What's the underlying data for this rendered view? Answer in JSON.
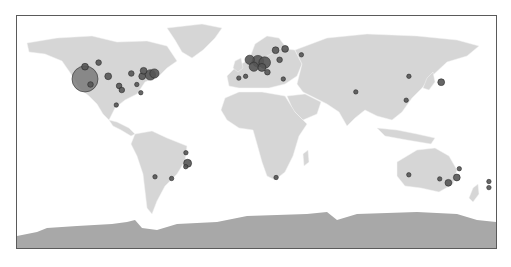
{
  "map": {
    "type": "world-bubble-map",
    "colors": {
      "land": "#d6d6d6",
      "antarctica": "#a8a8a8",
      "ocean": "#ffffff",
      "bubble_fill": "#555555",
      "bubble_fill_large": "#7a7a7a",
      "frame": "#5a5a5a"
    },
    "markers": [
      {
        "region": "us-west-coast",
        "lon": -122,
        "lat": 38,
        "size": 10
      },
      {
        "region": "us-northwest",
        "lon": -122,
        "lat": 47,
        "size": 2
      },
      {
        "region": "us-west",
        "lon": -112,
        "lat": 50,
        "size": 1.5
      },
      {
        "region": "us-southwest",
        "lon": -118,
        "lat": 34,
        "size": 1.5
      },
      {
        "region": "us-central",
        "lon": -105,
        "lat": 40,
        "size": 2
      },
      {
        "region": "us-central",
        "lon": -97,
        "lat": 33,
        "size": 1.5
      },
      {
        "region": "us-central",
        "lon": -95,
        "lat": 30,
        "size": 1.5
      },
      {
        "region": "us-midwest",
        "lon": -88,
        "lat": 42,
        "size": 1.5
      },
      {
        "region": "us-east",
        "lon": -80,
        "lat": 40,
        "size": 2
      },
      {
        "region": "us-northeast",
        "lon": -74,
        "lat": 41,
        "size": 3.5
      },
      {
        "region": "us-northeast",
        "lon": -71,
        "lat": 42,
        "size": 3
      },
      {
        "region": "canada-east",
        "lon": -79,
        "lat": 44,
        "size": 2
      },
      {
        "region": "us-southeast",
        "lon": -84,
        "lat": 34,
        "size": 1
      },
      {
        "region": "us-florida",
        "lon": -81,
        "lat": 28,
        "size": 1
      },
      {
        "region": "mexico",
        "lon": -99,
        "lat": 19,
        "size": 1
      },
      {
        "region": "uk",
        "lon": -1,
        "lat": 52,
        "size": 3
      },
      {
        "region": "benelux",
        "lon": 5,
        "lat": 51,
        "size": 4
      },
      {
        "region": "germany",
        "lon": 10,
        "lat": 50,
        "size": 4
      },
      {
        "region": "france",
        "lon": 2,
        "lat": 47,
        "size": 3
      },
      {
        "region": "switzerland",
        "lon": 8,
        "lat": 46.5,
        "size": 2.5
      },
      {
        "region": "italy",
        "lon": 12,
        "lat": 43,
        "size": 1.5
      },
      {
        "region": "spain",
        "lon": -4,
        "lat": 40,
        "size": 1
      },
      {
        "region": "portugal",
        "lon": -9,
        "lat": 38.7,
        "size": 1
      },
      {
        "region": "scandinavia",
        "lon": 18,
        "lat": 59,
        "size": 2
      },
      {
        "region": "finland",
        "lon": 25,
        "lat": 60,
        "size": 2
      },
      {
        "region": "poland",
        "lon": 21,
        "lat": 52,
        "size": 1.5
      },
      {
        "region": "russia-west",
        "lon": 37,
        "lat": 55.7,
        "size": 1
      },
      {
        "region": "greece",
        "lon": 23.7,
        "lat": 38,
        "size": 1
      },
      {
        "region": "india",
        "lon": 77,
        "lat": 28.6,
        "size": 1
      },
      {
        "region": "china",
        "lon": 116,
        "lat": 40,
        "size": 1
      },
      {
        "region": "japan",
        "lon": 139.7,
        "lat": 35.7,
        "size": 2
      },
      {
        "region": "south-china",
        "lon": 114,
        "lat": 22.5,
        "size": 1
      },
      {
        "region": "brazil-southeast",
        "lon": -46.6,
        "lat": -23.5,
        "size": 2.5
      },
      {
        "region": "brazil-south",
        "lon": -48,
        "lat": -26,
        "size": 1
      },
      {
        "region": "brazil",
        "lon": -47.9,
        "lat": -15.8,
        "size": 1
      },
      {
        "region": "argentina",
        "lon": -58.4,
        "lat": -34.6,
        "size": 1
      },
      {
        "region": "chile",
        "lon": -70.6,
        "lat": -33.4,
        "size": 1
      },
      {
        "region": "south-africa",
        "lon": 18.4,
        "lat": -33.9,
        "size": 1
      },
      {
        "region": "australia-west",
        "lon": 115.9,
        "lat": -31.9,
        "size": 1
      },
      {
        "region": "australia-east",
        "lon": 151.2,
        "lat": -33.9,
        "size": 2
      },
      {
        "region": "australia-southeast",
        "lon": 145,
        "lat": -37.8,
        "size": 2
      },
      {
        "region": "australia-south",
        "lon": 138.6,
        "lat": -34.9,
        "size": 1
      },
      {
        "region": "australia-north",
        "lon": 153,
        "lat": -27.5,
        "size": 1
      },
      {
        "region": "new-zealand",
        "lon": 174.8,
        "lat": -36.8,
        "size": 1
      },
      {
        "region": "new-zealand-south",
        "lon": 174.8,
        "lat": -41.3,
        "size": 1
      }
    ]
  }
}
